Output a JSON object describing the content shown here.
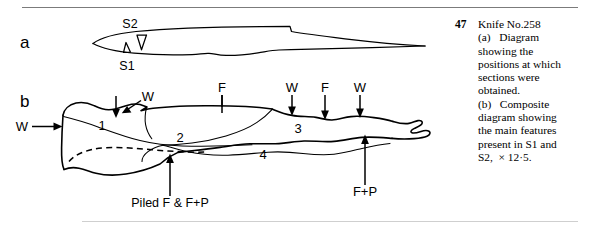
{
  "figure": {
    "number": "47",
    "caption_lines": [
      "Knife No.258",
      "(a)   Diagram",
      "showing the",
      "positions at which",
      "sections were",
      "obtained.",
      "(b)   Composite",
      "diagram showing",
      "the main features",
      "present in S1 and",
      "S2,  × 12·5."
    ],
    "caption_full": "Knife No.258 (a) Diagram showing the positions at which sections were obtained. (b) Composite diagram showing the main features present in S1 and S2, × 12·5.",
    "panel_a_label": "a",
    "panel_b_label": "b",
    "line_color": "#000000",
    "background_color": "#ffffff"
  },
  "panel_a": {
    "label": "a",
    "section_markers": [
      {
        "name": "S2",
        "label": "S2"
      },
      {
        "name": "S1",
        "label": "S1"
      }
    ]
  },
  "panel_b": {
    "label": "b",
    "zone_numbers": [
      "1",
      "2",
      "3",
      "4"
    ],
    "annotations": [
      {
        "name": "w-left",
        "label": "W"
      },
      {
        "name": "w-upper",
        "label": "W"
      },
      {
        "name": "f-mid",
        "label": "F"
      },
      {
        "name": "w-mid",
        "label": "W"
      },
      {
        "name": "f-right",
        "label": "F"
      },
      {
        "name": "w-right",
        "label": "W"
      },
      {
        "name": "f-plus-p",
        "label": "F+P"
      },
      {
        "name": "piled",
        "label": "Piled F & F+P"
      }
    ]
  }
}
